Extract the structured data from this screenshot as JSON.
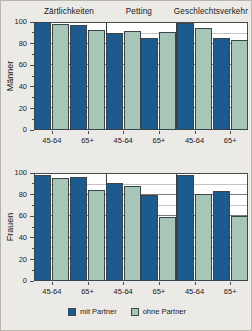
{
  "chart_data": {
    "type": "bar",
    "title": "",
    "xlabel": "",
    "ylim": [
      0,
      100
    ],
    "yticks": [
      0,
      20,
      40,
      60,
      80,
      100
    ],
    "yminor": [
      10,
      30,
      50,
      70,
      90
    ],
    "grid": true,
    "legend_position": "bottom",
    "categories": [
      "45-64",
      "65+"
    ],
    "panels": [
      "Zärtlichkeiten",
      "Petting",
      "Geschlechtsverkehr"
    ],
    "subplots": [
      {
        "ylabel": "Männer",
        "panels": [
          {
            "title": "Zärtlichkeiten",
            "series": [
              {
                "name": "mit Partner",
                "values": [
                  100,
                  97
                ]
              },
              {
                "name": "ohne Partner",
                "values": [
                  98,
                  93
                ]
              }
            ]
          },
          {
            "title": "Petting",
            "series": [
              {
                "name": "mit Partner",
                "values": [
                  90,
                  85
                ]
              },
              {
                "name": "ohne Partner",
                "values": [
                  92,
                  91
                ]
              }
            ]
          },
          {
            "title": "Geschlechtsverkehr",
            "series": [
              {
                "name": "mit Partner",
                "values": [
                  99,
                  85
                ]
              },
              {
                "name": "ohne Partner",
                "values": [
                  94,
                  83
                ]
              }
            ]
          }
        ]
      },
      {
        "ylabel": "Frauen",
        "panels": [
          {
            "title": "Zärtlichkeiten",
            "series": [
              {
                "name": "mit Partner",
                "values": [
                  98,
                  96
                ]
              },
              {
                "name": "ohne Partner",
                "values": [
                  95,
                  84
                ]
              }
            ]
          },
          {
            "title": "Petting",
            "series": [
              {
                "name": "mit Partner",
                "values": [
                  91,
                  80
                ]
              },
              {
                "name": "ohne Partner",
                "values": [
                  88,
                  59
                ]
              }
            ]
          },
          {
            "title": "Geschlechtsverkehr",
            "series": [
              {
                "name": "mit Partner",
                "values": [
                  98,
                  83
                ]
              },
              {
                "name": "ohne Partner",
                "values": [
                  81,
                  60
                ]
              }
            ]
          }
        ]
      }
    ],
    "legend": [
      {
        "label": "mit Partner",
        "color": "#1d5a8e"
      },
      {
        "label": "ohne Partner",
        "color": "#a8c6b8"
      }
    ]
  },
  "colors": {
    "mit_partner": "#1d5a8e",
    "ohne_partner": "#a8c6b8",
    "background": "#eceae6",
    "plot_background": "#ffffff",
    "axis": "#4a4a4a"
  }
}
